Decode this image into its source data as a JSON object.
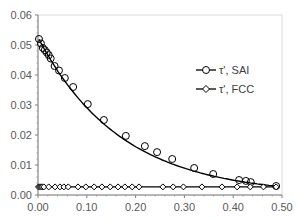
{
  "chart_data": {
    "type": "line",
    "title": "",
    "xlabel": "",
    "ylabel": "",
    "xlim": [
      0.0,
      0.5
    ],
    "ylim": [
      0.0,
      0.06
    ],
    "x_ticks": [
      "0.00",
      "0.10",
      "0.20",
      "0.30",
      "0.40",
      "0.50"
    ],
    "y_ticks": [
      "0.00",
      "0.01",
      "0.02",
      "0.03",
      "0.04",
      "0.05",
      "0.06"
    ],
    "grid": false,
    "legend_position": "right-center inside",
    "series": [
      {
        "name": "τ', SAI",
        "marker": "circle-open",
        "color": "#000000",
        "x": [
          0.002,
          0.006,
          0.01,
          0.014,
          0.018,
          0.022,
          0.026,
          0.034,
          0.043,
          0.055,
          0.072,
          0.102,
          0.135,
          0.18,
          0.219,
          0.244,
          0.275,
          0.32,
          0.359,
          0.412,
          0.426,
          0.436,
          0.488
        ],
        "y": [
          0.052,
          0.0505,
          0.049,
          0.0483,
          0.0475,
          0.0466,
          0.0455,
          0.043,
          0.0415,
          0.039,
          0.036,
          0.0303,
          0.025,
          0.0197,
          0.0163,
          0.0143,
          0.012,
          0.009,
          0.007,
          0.005,
          0.0047,
          0.0043,
          0.003
        ]
      },
      {
        "name": "τ', FCC",
        "marker": "diamond-open",
        "color": "#000000",
        "x": [
          0.001,
          0.003,
          0.005,
          0.007,
          0.009,
          0.012,
          0.022,
          0.035,
          0.045,
          0.053,
          0.062,
          0.082,
          0.098,
          0.115,
          0.131,
          0.148,
          0.164,
          0.178,
          0.193,
          0.207,
          0.256,
          0.277,
          0.298,
          0.336,
          0.377,
          0.408,
          0.435,
          0.462,
          0.488
        ],
        "y": [
          0.0027,
          0.0027,
          0.0027,
          0.0027,
          0.0027,
          0.0027,
          0.0027,
          0.0027,
          0.0027,
          0.0027,
          0.0027,
          0.0027,
          0.0027,
          0.0027,
          0.0027,
          0.0027,
          0.0027,
          0.0027,
          0.0027,
          0.0027,
          0.0027,
          0.0027,
          0.0027,
          0.0027,
          0.0027,
          0.0027,
          0.0027,
          0.0027,
          0.0027
        ]
      }
    ]
  },
  "legend": {
    "items": [
      {
        "label": "τ', SAI",
        "marker": "circle-open"
      },
      {
        "label": "τ', FCC",
        "marker": "diamond-open"
      }
    ]
  }
}
